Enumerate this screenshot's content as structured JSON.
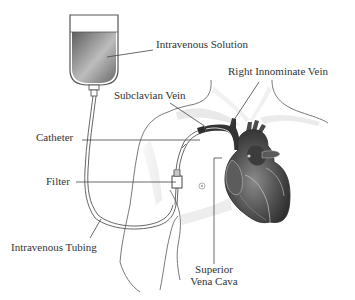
{
  "diagram": {
    "labels": {
      "intravenous_solution": "Intravenous Solution",
      "subclavian_vein": "Subclavian Vein",
      "right_innominate_vein": "Right Innominate Vein",
      "catheter": "Catheter",
      "filter": "Filter",
      "intravenous_tubing": "Intravenous Tubing",
      "superior_vena_cava_line1": "Superior",
      "superior_vena_cava_line2": "Vena Cava"
    },
    "colors": {
      "background": "#ffffff",
      "text": "#333333",
      "leader_line": "#444444",
      "bag_fluid": "#7a7a7a",
      "heart_dark": "#3a3a3a",
      "heart_mid": "#5a5a5a",
      "body_outline": "#666666",
      "body_shadow": "#e4e4e4"
    }
  }
}
